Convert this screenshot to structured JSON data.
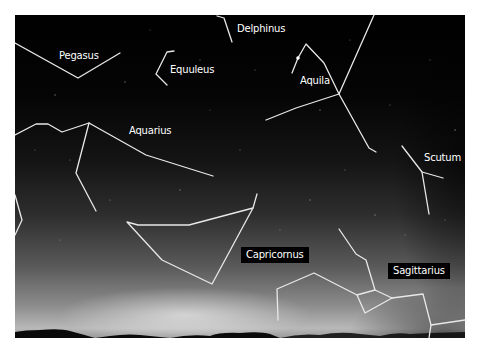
{
  "figure": {
    "background_color": "#ffffff",
    "sky_colors": {
      "top": "#000000",
      "horizon": "#b8b8b8"
    },
    "line_color": "#e8e8e8"
  },
  "constellations": [
    {
      "name": "Pegasus",
      "label": "Pegasus",
      "label_pos": [
        59,
        50
      ],
      "boxed": false
    },
    {
      "name": "Equuleus",
      "label": "Equuleus",
      "label_pos": [
        170,
        64
      ],
      "boxed": false
    },
    {
      "name": "Delphinus",
      "label": "Delphinus",
      "label_pos": [
        237,
        23
      ],
      "boxed": false
    },
    {
      "name": "Aquila",
      "label": "Aquila",
      "label_pos": [
        300,
        75
      ],
      "boxed": false
    },
    {
      "name": "Aquarius",
      "label": "Aquarius",
      "label_pos": [
        129,
        125
      ],
      "boxed": false
    },
    {
      "name": "Scutum",
      "label": "Scutum",
      "label_pos": [
        424,
        152
      ],
      "boxed": false
    },
    {
      "name": "Capricornus",
      "label": "Capricornus",
      "label_pos": [
        241,
        248
      ],
      "boxed": true
    },
    {
      "name": "Sagittarius",
      "label": "Sagittarius",
      "label_pos": [
        388,
        264
      ],
      "boxed": true
    }
  ]
}
